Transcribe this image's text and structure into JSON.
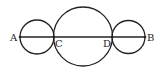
{
  "diagram": {
    "points": [
      {
        "id": "A",
        "label": "A"
      },
      {
        "id": "C",
        "label": "C"
      },
      {
        "id": "D",
        "label": "D"
      },
      {
        "id": "B",
        "label": "B"
      }
    ],
    "circles": [
      {
        "id": "left",
        "diameter": "AC"
      },
      {
        "id": "middle",
        "diameter": "CD"
      },
      {
        "id": "right",
        "diameter": "DB"
      }
    ],
    "segment": "AB",
    "stroke_color": "#222222"
  }
}
